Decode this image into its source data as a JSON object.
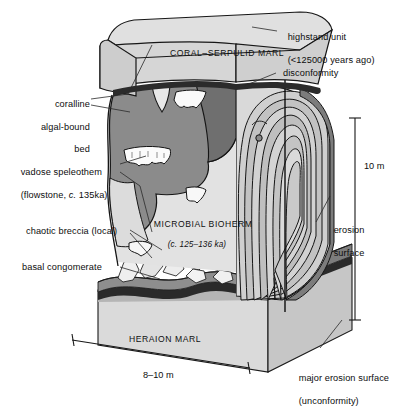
{
  "figure": {
    "type": "geological-block-diagram"
  },
  "units": {
    "top_block": {
      "name": "CORAL–SERPULID MARL"
    },
    "core": {
      "name": "MICROBIAL BIOHERM",
      "age": "(c. 125–136 ka)"
    },
    "bottom_block": {
      "name": "HERAION MARL"
    }
  },
  "annotations": {
    "highstand": {
      "line1": "highstand unit",
      "line2": "(<125000 years ago)"
    },
    "disconformity": "disconformity",
    "erosion_surface": {
      "line1": "erosion",
      "line2": "surface"
    },
    "major_erosion": {
      "line1": "major erosion surface",
      "line2": "(unconformity)"
    },
    "coralline": {
      "line1": "coralline",
      "line2": "algal-bound",
      "line3": "bed"
    },
    "speleothem": {
      "line1": "vadose speleothem",
      "line2": "(flowstone, ",
      "line2_italic": "c.",
      "line2_end": " 135ka)"
    },
    "breccia": "chaotic breccia (local)",
    "conglomerate": "basal congomerate"
  },
  "scales": {
    "vertical": "10 m",
    "horizontal": "8–10 m"
  },
  "colors": {
    "paper": "#ffffff",
    "light_gray": "#d6d6d6",
    "mid_gray": "#bdbdbd",
    "dark_gray": "#8b8b8b",
    "darker_gray": "#6f6f6f",
    "speleothem_white": "#fbfbfb",
    "outline": "#141414"
  }
}
